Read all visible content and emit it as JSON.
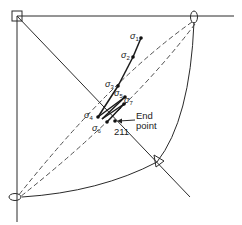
{
  "diagram": {
    "markers": {
      "square": "square-marker",
      "ellipse_top": "ellipse-marker",
      "ellipse_bottom": "ellipse-marker",
      "triangle": "triangle-marker"
    },
    "points": [
      {
        "symbol": "σ",
        "sub": "1"
      },
      {
        "symbol": "σ",
        "sub": "2"
      },
      {
        "symbol": "σ",
        "sub": "3"
      },
      {
        "symbol": "σ",
        "sub": "5"
      },
      {
        "symbol": "σ",
        "sub": "7"
      },
      {
        "symbol": "σ",
        "sub": "4"
      },
      {
        "symbol": "σ",
        "sub": "6"
      }
    ],
    "end_point": {
      "label_line1": "End",
      "label_line2": "point",
      "number": "211"
    },
    "colors": {
      "ink": "#2a2a2a",
      "background": "#ffffff"
    }
  }
}
